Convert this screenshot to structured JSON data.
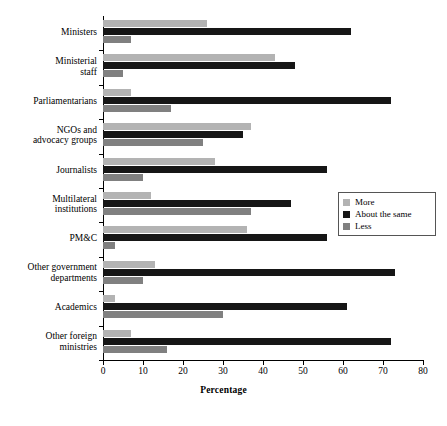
{
  "chart_data": {
    "type": "bar",
    "orientation": "horizontal",
    "title": "",
    "xlabel": "Percentage",
    "ylabel": "",
    "xlim": [
      0,
      80
    ],
    "xticks": [
      0,
      10,
      20,
      30,
      40,
      50,
      60,
      70,
      80
    ],
    "grid": false,
    "legend_position": "center-right",
    "categories": [
      "Ministers",
      "Ministerial staff",
      "Parliamentarians",
      "NGOs and advocacy groups",
      "Journalists",
      "Multilateral institutions",
      "PM&C",
      "Other government departments",
      "Academics",
      "Other foreign ministries"
    ],
    "series": [
      {
        "name": "More",
        "color": "#b3b3b3",
        "values": [
          26,
          43,
          7,
          37,
          28,
          12,
          36,
          13,
          3,
          7
        ]
      },
      {
        "name": "About the same",
        "color": "#161616",
        "values": [
          62,
          48,
          72,
          35,
          56,
          47,
          56,
          73,
          61,
          72
        ]
      },
      {
        "name": "Less",
        "color": "#808080",
        "values": [
          7,
          5,
          17,
          25,
          10,
          37,
          3,
          10,
          30,
          16
        ]
      }
    ]
  },
  "legend": {
    "items": [
      {
        "label": "More"
      },
      {
        "label": "About the same"
      },
      {
        "label": "Less"
      }
    ]
  },
  "axis": {
    "x_title": "Percentage",
    "tick_labels": [
      "0",
      "10",
      "20",
      "30",
      "40",
      "50",
      "60",
      "70",
      "80"
    ]
  },
  "category_labels": [
    {
      "lines": [
        "Ministers"
      ]
    },
    {
      "lines": [
        "Ministerial",
        "staff"
      ]
    },
    {
      "lines": [
        "Parliamentarians"
      ]
    },
    {
      "lines": [
        "NGOs and",
        "advocacy groups"
      ]
    },
    {
      "lines": [
        "Journalists"
      ]
    },
    {
      "lines": [
        "Multilateral",
        "institutions"
      ]
    },
    {
      "lines": [
        "PM&C"
      ]
    },
    {
      "lines": [
        "Other government",
        "departments"
      ]
    },
    {
      "lines": [
        "Academics"
      ]
    },
    {
      "lines": [
        "Other foreign",
        "ministries"
      ]
    }
  ]
}
